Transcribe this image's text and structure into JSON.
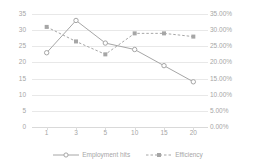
{
  "chart_data": {
    "type": "line",
    "title": "",
    "xlabel": "",
    "ylabel": "",
    "categories": [
      "1",
      "3",
      "5",
      "10",
      "15",
      "20"
    ],
    "grid": true,
    "legend_position": "bottom",
    "axes": {
      "left": {
        "label": "",
        "ylim": [
          0,
          35
        ],
        "ticks": [
          "0",
          "5",
          "10",
          "15",
          "20",
          "25",
          "30",
          "35"
        ],
        "tick_values": [
          0,
          5,
          10,
          15,
          20,
          25,
          30,
          35
        ]
      },
      "right": {
        "label": "",
        "ylim": [
          0,
          35
        ],
        "ticks": [
          "0.00%",
          "5.00%",
          "10.00%",
          "15.00%",
          "20.00%",
          "25.00%",
          "30.00%",
          "35.00%"
        ],
        "tick_values": [
          0,
          5,
          10,
          15,
          20,
          25,
          30,
          35
        ]
      }
    },
    "series": [
      {
        "name": "Employment hits",
        "axis": "left",
        "style": "solid",
        "marker": "circle",
        "color": "#a6a6a6",
        "values": [
          23,
          33,
          26,
          24,
          19,
          14
        ]
      },
      {
        "name": "Efficiency",
        "axis": "right",
        "style": "dashed",
        "marker": "circle",
        "color": "#a6a6a6",
        "values": [
          31,
          26.5,
          22.5,
          29,
          29,
          28
        ],
        "value_labels": [
          "31.00%",
          "26.50%",
          "22.50%",
          "29.00%",
          "29.00%",
          "28.00%"
        ]
      }
    ]
  },
  "legend": {
    "items": [
      {
        "label": "Employment hits"
      },
      {
        "label": "Efficiency"
      }
    ]
  },
  "colors": {
    "series": "#a6a6a6",
    "grid": "#e8e8e8",
    "tick_text": "#a6a6a6",
    "background": "#ffffff"
  }
}
